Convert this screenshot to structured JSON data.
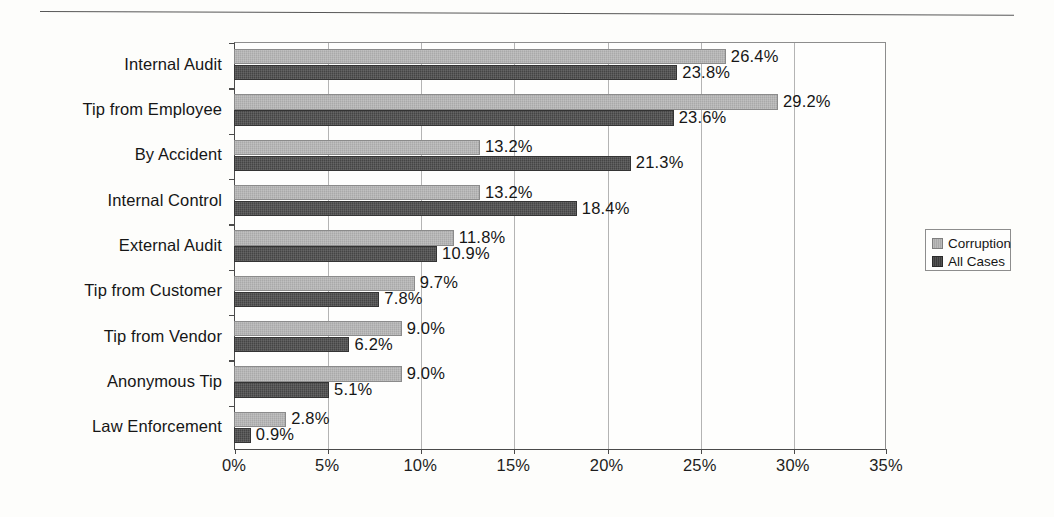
{
  "chart_data": {
    "type": "bar",
    "orientation": "horizontal",
    "title": "",
    "xlabel": "",
    "ylabel": "",
    "xlim": [
      0,
      35
    ],
    "xticks": [
      "0%",
      "5%",
      "10%",
      "15%",
      "20%",
      "25%",
      "30%",
      "35%"
    ],
    "xtick_values": [
      0,
      5,
      10,
      15,
      20,
      25,
      30,
      35
    ],
    "grid": "vertical",
    "legend_position": "right",
    "categories": [
      "Internal Audit",
      "Tip from Employee",
      "By Accident",
      "Internal Control",
      "External Audit",
      "Tip from Customer",
      "Tip from Vendor",
      "Anonymous Tip",
      "Law Enforcement"
    ],
    "series": [
      {
        "name": "Corruption",
        "color": "#a9a9a9",
        "values": [
          26.4,
          29.2,
          13.2,
          13.2,
          11.8,
          9.7,
          9.0,
          9.0,
          2.8
        ],
        "labels": [
          "26.4%",
          "29.2%",
          "13.2%",
          "13.2%",
          "11.8%",
          "9.7%",
          "9.0%",
          "9.0%",
          "2.8%"
        ]
      },
      {
        "name": "All Cases",
        "color": "#454545",
        "values": [
          23.8,
          23.6,
          21.3,
          18.4,
          10.9,
          7.8,
          6.2,
          5.1,
          0.9
        ],
        "labels": [
          "23.8%",
          "23.6%",
          "21.3%",
          "18.4%",
          "10.9%",
          "7.8%",
          "6.2%",
          "5.1%",
          "0.9%"
        ]
      }
    ]
  },
  "legend": {
    "items": [
      {
        "label": "Corruption"
      },
      {
        "label": "All Cases"
      }
    ]
  }
}
